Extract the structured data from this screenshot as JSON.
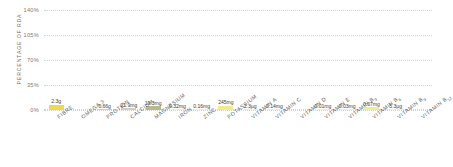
{
  "chart_data": {
    "type": "bar",
    "title": "",
    "xlabel": "",
    "ylabel": "PERCENTAGE OF RDA",
    "ylim": [
      0,
      140
    ],
    "yticks": [
      "0%",
      "35%",
      "70%",
      "105%",
      "140%"
    ],
    "ytick_values": [
      0,
      35,
      70,
      105,
      140
    ],
    "grid": true,
    "legend": "none",
    "bar_color": "#f2d750",
    "categories": [
      "FIBRE",
      "OMEGA 3",
      "PROTEIN",
      "CALCIUM",
      "MAGNESIUM",
      "IRON",
      "ZINC",
      "POTASSIUM",
      "VITAMIN A",
      "VITAMIN C",
      "VITAMIN D",
      "VITAMIN E",
      "VITAMIN B3",
      "VITAMIN B6",
      "VITAMIN B9",
      "VITAMIN B12"
    ],
    "data_labels": [
      "2.3g",
      "",
      "0.66g",
      "21.9mg",
      "19.3mg",
      "0.32mg",
      "0.16mg",
      "245mg",
      "2.3µg",
      "0.14mg",
      "",
      "0.01mg",
      "0.03mg",
      "0.07mg",
      "5.3µg",
      ""
    ],
    "values": [
      7.6,
      0,
      1.3,
      2.2,
      5.1,
      1.2,
      1.2,
      6.1,
      1.2,
      1.2,
      0,
      1.2,
      1.2,
      4.2,
      1.2,
      0
    ],
    "bar_colors": [
      "#f2d750",
      "transparent",
      "#cfcfc0",
      "#cfcfc0",
      "#b9b98f",
      "#ececec",
      "#ececec",
      "#f6e98d",
      "#ececec",
      "#ececec",
      "transparent",
      "#ececec",
      "#ececec",
      "#f6e98d",
      "#ececec",
      "transparent"
    ]
  }
}
